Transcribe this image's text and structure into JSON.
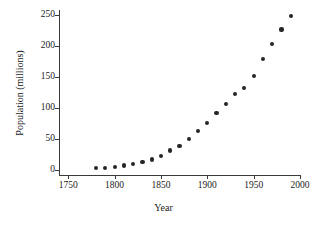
{
  "chart_data": {
    "type": "scatter",
    "title": "",
    "subtitle": "",
    "xlabel": "Year",
    "ylabel": "Population (millions)",
    "xlim": [
      1740,
      2000
    ],
    "ylim": [
      -8,
      258
    ],
    "xticks": [
      1750,
      1800,
      1850,
      1900,
      1950,
      2000
    ],
    "xtick_labels": [
      "1750",
      "1800",
      "1850",
      "1900",
      "1950",
      "2000"
    ],
    "yticks": [
      0,
      50,
      100,
      150,
      200,
      250
    ],
    "ytick_labels": [
      "0",
      "50",
      "100",
      "150",
      "200",
      "250"
    ],
    "grid": false,
    "legend": null,
    "marker": {
      "shape": "circle",
      "color": "#262626",
      "size_px": 4.2
    },
    "axis_color": "#3a3a3a",
    "background": "#ffffff",
    "x": [
      1780,
      1790,
      1800,
      1810,
      1820,
      1830,
      1840,
      1850,
      1860,
      1870,
      1880,
      1890,
      1900,
      1910,
      1920,
      1930,
      1940,
      1950,
      1960,
      1970,
      1980,
      1990
    ],
    "y": [
      2.8,
      3.9,
      5.3,
      7.2,
      9.6,
      12.9,
      17.1,
      23.2,
      31.4,
      38.6,
      50.2,
      63.0,
      76.2,
      92.2,
      106.0,
      123.2,
      132.2,
      151.3,
      179.3,
      203.3,
      226.5,
      248.7
    ],
    "points": [
      {
        "x": 1780,
        "y": 2.8
      },
      {
        "x": 1790,
        "y": 3.9
      },
      {
        "x": 1800,
        "y": 5.3
      },
      {
        "x": 1810,
        "y": 7.2
      },
      {
        "x": 1820,
        "y": 9.6
      },
      {
        "x": 1830,
        "y": 12.9
      },
      {
        "x": 1840,
        "y": 17.1
      },
      {
        "x": 1850,
        "y": 23.2
      },
      {
        "x": 1860,
        "y": 31.4
      },
      {
        "x": 1870,
        "y": 38.6
      },
      {
        "x": 1880,
        "y": 50.2
      },
      {
        "x": 1890,
        "y": 63.0
      },
      {
        "x": 1900,
        "y": 76.2
      },
      {
        "x": 1910,
        "y": 92.2
      },
      {
        "x": 1920,
        "y": 106.0
      },
      {
        "x": 1930,
        "y": 123.2
      },
      {
        "x": 1940,
        "y": 132.2
      },
      {
        "x": 1950,
        "y": 151.3
      },
      {
        "x": 1960,
        "y": 179.3
      },
      {
        "x": 1970,
        "y": 203.3
      },
      {
        "x": 1980,
        "y": 226.5
      },
      {
        "x": 1990,
        "y": 248.7
      }
    ]
  }
}
